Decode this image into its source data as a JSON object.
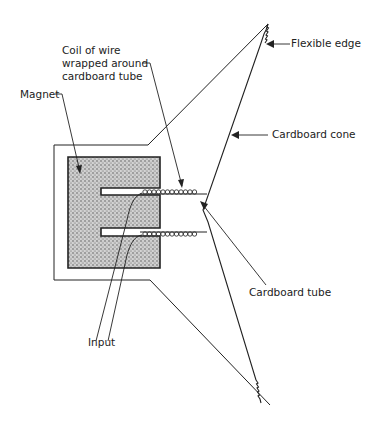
{
  "diagram": {
    "type": "loudspeaker-cross-section",
    "labels": {
      "coil_line1": "Coil of wire",
      "coil_line2": "wrapped around",
      "coil_line3": "cardboard tube",
      "magnet": "Magnet",
      "flexible_edge": "Flexible edge",
      "cardboard_cone": "Cardboard cone",
      "cardboard_tube": "Cardboard tube",
      "input": "Input"
    },
    "colors": {
      "line": "#222222",
      "magnet_fill": "#b8b8b8",
      "background": "#ffffff"
    }
  }
}
